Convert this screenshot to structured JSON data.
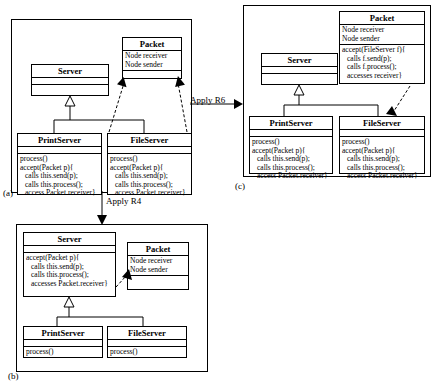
{
  "figure": {
    "type": "uml-class-diagram-refactoring",
    "panels": [
      {
        "id": "a",
        "label": "(a)",
        "classes": [
          {
            "name": "Server",
            "attributes": [],
            "methods": []
          },
          {
            "name": "Packet",
            "attributes": [
              "Node receiver",
              "Node sender"
            ],
            "methods": []
          },
          {
            "name": "PrintServer",
            "attributes": [],
            "methods": [
              "process()",
              "accept(Packet p){",
              "calls this.send(p);",
              "calls this.process();",
              "access Packet.receiver}"
            ]
          },
          {
            "name": "FileServer",
            "attributes": [],
            "methods": [
              "process()",
              "accept(Packet p){",
              "calls this.send(p);",
              "calls this.process();",
              "access Packet.receiver}"
            ]
          }
        ],
        "relations": [
          {
            "type": "generalization",
            "from": "PrintServer",
            "to": "Server"
          },
          {
            "type": "generalization",
            "from": "FileServer",
            "to": "Server"
          },
          {
            "type": "dependency",
            "from": "PrintServer",
            "to": "Packet"
          },
          {
            "type": "dependency",
            "from": "FileServer",
            "to": "Packet"
          }
        ]
      },
      {
        "id": "b",
        "label": "(b)",
        "classes": [
          {
            "name": "Server",
            "attributes": [],
            "methods": [
              "accept(Packet p){",
              "calls this.send(p);",
              "calls this.process();",
              "accesses Packet.receiver}"
            ]
          },
          {
            "name": "Packet",
            "attributes": [
              "Node receiver",
              "Node sender"
            ],
            "methods": []
          },
          {
            "name": "PrintServer",
            "attributes": [],
            "methods": [
              "process()"
            ]
          },
          {
            "name": "FileServer",
            "attributes": [],
            "methods": [
              "process()"
            ]
          }
        ],
        "relations": [
          {
            "type": "generalization",
            "from": "PrintServer",
            "to": "Server"
          },
          {
            "type": "generalization",
            "from": "FileServer",
            "to": "Server"
          },
          {
            "type": "dependency",
            "from": "Server",
            "to": "Packet"
          }
        ]
      },
      {
        "id": "c",
        "label": "(c)",
        "classes": [
          {
            "name": "Packet",
            "attributes": [
              "Node receiver",
              "Node sender"
            ],
            "methods": [
              "accept(FileServer f){",
              "calls f.send(p);",
              "calls f.process();",
              "accesses receiver}"
            ]
          },
          {
            "name": "Server",
            "attributes": [],
            "methods": []
          },
          {
            "name": "PrintServer",
            "attributes": [],
            "methods": [
              "process()",
              "accept(Packet p){",
              "calls this.send(p);",
              "calls this.process();",
              "access Packet.receiver}"
            ]
          },
          {
            "name": "FileServer",
            "attributes": [],
            "methods": [
              "process()",
              "accept(Packet p){",
              "calls this.send(p);",
              "calls this.process();",
              "access Packet.receiver}"
            ]
          }
        ],
        "relations": [
          {
            "type": "generalization",
            "from": "PrintServer",
            "to": "Server"
          },
          {
            "type": "generalization",
            "from": "FileServer",
            "to": "Server"
          },
          {
            "type": "dependency",
            "from": "Packet",
            "to": "FileServer"
          }
        ]
      }
    ],
    "transitions": [
      {
        "id": "r6",
        "label": "Apply R6",
        "from": "a",
        "to": "c"
      },
      {
        "id": "r4",
        "label": "Apply R4",
        "from": "a",
        "to": "b"
      }
    ]
  }
}
